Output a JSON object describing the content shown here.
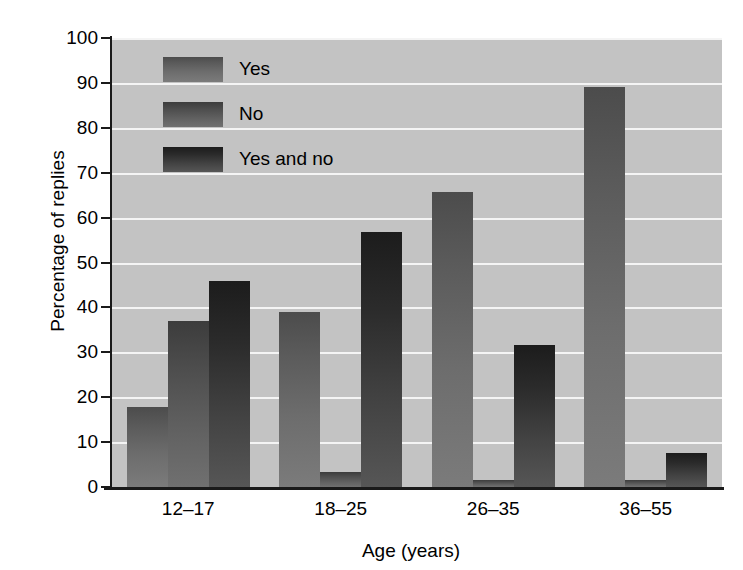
{
  "chart_data": {
    "type": "bar",
    "title": "",
    "xlabel": "Age (years)",
    "ylabel": "Percentage of replies",
    "categories": [
      "12–17",
      "18–25",
      "26–35",
      "36–55"
    ],
    "series": [
      {
        "name": "Yes",
        "values": [
          17.8,
          38.9,
          65.6,
          89.0
        ],
        "color": "#666666"
      },
      {
        "name": "No",
        "values": [
          37.0,
          3.4,
          1.5,
          1.5
        ],
        "color": "#565656"
      },
      {
        "name": "Yes and no",
        "values": [
          45.8,
          56.8,
          31.7,
          7.5
        ],
        "color": "#333333"
      }
    ],
    "ylim": [
      0,
      100
    ],
    "ytick_labels": [
      "0",
      "10",
      "20",
      "30",
      "40",
      "50",
      "60",
      "70",
      "80",
      "90",
      "100"
    ],
    "ytick_values": [
      0,
      10,
      20,
      30,
      40,
      50,
      60,
      70,
      80,
      90,
      100
    ],
    "grid": true,
    "grid_color": "#f4f4f4",
    "plot_background": "#c3c3c3",
    "legend_position": "top-left",
    "legend_entries": [
      "Yes",
      "No",
      "Yes and no"
    ]
  }
}
